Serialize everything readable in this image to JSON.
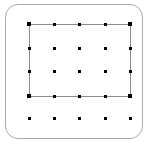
{
  "diagram": {
    "canvas": {
      "width": 149,
      "height": 144,
      "background": "#ffffff"
    },
    "card": {
      "label": "rounded card frame",
      "x": 5,
      "y": 4,
      "width": 138,
      "height": 135,
      "corner_radius": 13,
      "border_color": "#a9a9a9",
      "fill_color": "#ffffff",
      "border_width": 1
    },
    "enclosure": {
      "label": "rectangle outline",
      "x": 29,
      "y": 24,
      "width": 102,
      "height": 73,
      "border_color": "#8c8c8c",
      "border_width": 1,
      "fill": "none",
      "encloses_rows": 4,
      "encloses_columns": 5,
      "encloses_dot_count": 20
    },
    "grid": {
      "label": "dot lattice",
      "rows": 5,
      "columns": 5,
      "total_dots": 25,
      "dot_color": "#000000",
      "dot_size": 3,
      "corner_dot_size": 4,
      "column_x": [
        29,
        54,
        79,
        105,
        130
      ],
      "row_y": [
        24,
        48,
        71,
        96,
        118
      ],
      "rows_inside_rectangle": [
        1,
        2,
        3,
        4
      ],
      "rows_outside_rectangle": [
        5
      ],
      "dots": [
        {
          "row": 1,
          "col": 1,
          "x": 29,
          "y": 24,
          "inside": true,
          "corner": true
        },
        {
          "row": 1,
          "col": 2,
          "x": 54,
          "y": 24,
          "inside": true,
          "corner": false
        },
        {
          "row": 1,
          "col": 3,
          "x": 79,
          "y": 24,
          "inside": true,
          "corner": false
        },
        {
          "row": 1,
          "col": 4,
          "x": 105,
          "y": 24,
          "inside": true,
          "corner": false
        },
        {
          "row": 1,
          "col": 5,
          "x": 130,
          "y": 24,
          "inside": true,
          "corner": true
        },
        {
          "row": 2,
          "col": 1,
          "x": 29,
          "y": 48,
          "inside": true,
          "corner": false
        },
        {
          "row": 2,
          "col": 2,
          "x": 54,
          "y": 48,
          "inside": true,
          "corner": false
        },
        {
          "row": 2,
          "col": 3,
          "x": 79,
          "y": 48,
          "inside": true,
          "corner": false
        },
        {
          "row": 2,
          "col": 4,
          "x": 105,
          "y": 48,
          "inside": true,
          "corner": false
        },
        {
          "row": 2,
          "col": 5,
          "x": 130,
          "y": 48,
          "inside": true,
          "corner": false
        },
        {
          "row": 3,
          "col": 1,
          "x": 29,
          "y": 71,
          "inside": true,
          "corner": false
        },
        {
          "row": 3,
          "col": 2,
          "x": 54,
          "y": 71,
          "inside": true,
          "corner": false
        },
        {
          "row": 3,
          "col": 3,
          "x": 79,
          "y": 71,
          "inside": true,
          "corner": false
        },
        {
          "row": 3,
          "col": 4,
          "x": 105,
          "y": 71,
          "inside": true,
          "corner": false
        },
        {
          "row": 3,
          "col": 5,
          "x": 130,
          "y": 71,
          "inside": true,
          "corner": false
        },
        {
          "row": 4,
          "col": 1,
          "x": 29,
          "y": 96,
          "inside": true,
          "corner": true
        },
        {
          "row": 4,
          "col": 2,
          "x": 54,
          "y": 96,
          "inside": true,
          "corner": false
        },
        {
          "row": 4,
          "col": 3,
          "x": 79,
          "y": 96,
          "inside": true,
          "corner": false
        },
        {
          "row": 4,
          "col": 4,
          "x": 105,
          "y": 96,
          "inside": true,
          "corner": false
        },
        {
          "row": 4,
          "col": 5,
          "x": 130,
          "y": 96,
          "inside": true,
          "corner": true
        },
        {
          "row": 5,
          "col": 1,
          "x": 29,
          "y": 118,
          "inside": false,
          "corner": false
        },
        {
          "row": 5,
          "col": 2,
          "x": 54,
          "y": 118,
          "inside": false,
          "corner": false
        },
        {
          "row": 5,
          "col": 3,
          "x": 79,
          "y": 118,
          "inside": false,
          "corner": false
        },
        {
          "row": 5,
          "col": 4,
          "x": 105,
          "y": 118,
          "inside": false,
          "corner": false
        },
        {
          "row": 5,
          "col": 5,
          "x": 130,
          "y": 118,
          "inside": false,
          "corner": false
        }
      ]
    }
  }
}
